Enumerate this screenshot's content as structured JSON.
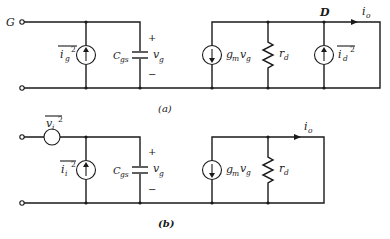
{
  "figure": {
    "type": "small-signal noise equivalent circuits (FET)",
    "colors": {
      "line": "#1a1a1a",
      "background": "#ffffff"
    }
  },
  "circuit_a": {
    "caption": "(a)",
    "gate_label": "G",
    "drain_label": "D",
    "gate_noise_source": {
      "label": "i",
      "sub": "g",
      "sup": "2",
      "direction": "up"
    },
    "capacitor": {
      "label": "C",
      "sub": "gs",
      "voltage": "v",
      "voltage_sub": "g",
      "plus": "+",
      "minus": "−"
    },
    "dependent_source": {
      "label": "g",
      "sub": "m",
      "mult": "v",
      "mult_sub": "g",
      "direction": "down"
    },
    "resistor": {
      "label": "r",
      "sub": "d"
    },
    "drain_noise_source": {
      "label": "i",
      "sub": "d",
      "sup": "2",
      "direction": "up"
    },
    "output_current": {
      "label": "i",
      "sub": "o"
    }
  },
  "circuit_b": {
    "caption": "(b)",
    "input_noise_voltage": {
      "label": "v",
      "sub": "i",
      "sup": "2"
    },
    "input_noise_current": {
      "label": "i",
      "sub": "i",
      "sup": "2",
      "direction": "up"
    },
    "capacitor": {
      "label": "C",
      "sub": "gs",
      "voltage": "v",
      "voltage_sub": "g",
      "plus": "+",
      "minus": "−"
    },
    "dependent_source": {
      "label": "g",
      "sub": "m",
      "mult": "v",
      "mult_sub": "g",
      "direction": "down"
    },
    "resistor": {
      "label": "r",
      "sub": "d"
    },
    "output_current": {
      "label": "i",
      "sub": "o"
    }
  }
}
